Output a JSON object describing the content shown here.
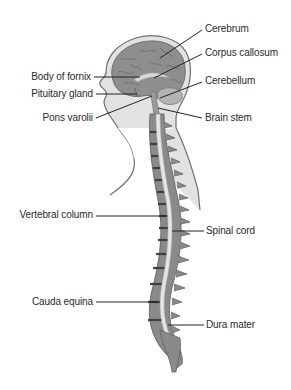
{
  "figure": {
    "type": "anatomical-diagram",
    "colors": {
      "skin_outline": "#6e6e6e",
      "head_fill": "#e2e2e2",
      "brain_fill": "#8e8e8e",
      "brain_fold": "#6f6f6f",
      "vertebra_fill": "#8a8a8a",
      "disc_fill": "#4a4a4a",
      "spinal_cord_fill": "#e4e4e4",
      "leader_line": "#222222",
      "label_text": "#2a2a2a"
    }
  },
  "labels": {
    "left": [
      {
        "id": "body-of-fornix",
        "text": "Body of fornix"
      },
      {
        "id": "pituitary-gland",
        "text": "Pituitary gland"
      },
      {
        "id": "pons-varolii",
        "text": "Pons varolii"
      },
      {
        "id": "vertebral-column",
        "text": "Vertebral column"
      },
      {
        "id": "cauda-equina",
        "text": "Cauda equina"
      }
    ],
    "right": [
      {
        "id": "cerebrum",
        "text": "Cerebrum"
      },
      {
        "id": "corpus-callosum",
        "text": "Corpus callosum"
      },
      {
        "id": "cerebellum",
        "text": "Cerebellum"
      },
      {
        "id": "brain-stem",
        "text": "Brain stem"
      },
      {
        "id": "spinal-cord",
        "text": "Spinal cord"
      },
      {
        "id": "dura-mater",
        "text": "Dura mater"
      }
    ]
  },
  "caption": {
    "text": ""
  }
}
